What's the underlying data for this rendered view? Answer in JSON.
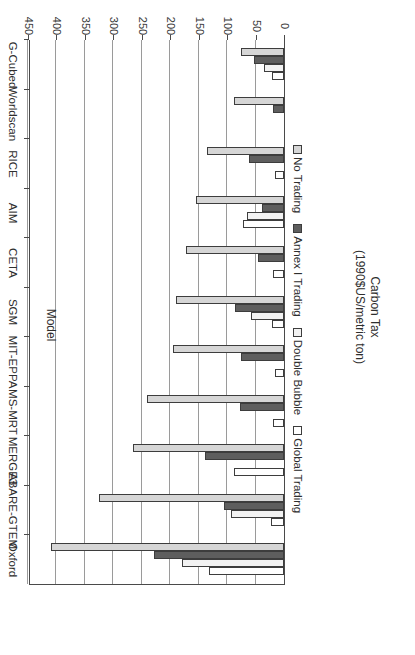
{
  "chart_data": {
    "type": "bar",
    "orientation": "horizontal",
    "title": "",
    "xlabel": "Carbon Tax (1990$US/metric ton)",
    "ylabel": "Model",
    "xlabel_line1": "Carbon Tax",
    "xlabel_line2": "(1990$US/metric ton)",
    "categories": [
      "Oxford",
      "ABARE-GTEM",
      "MERGE3",
      "MS-MRT",
      "MIT-EPPA",
      "SGM",
      "CETA",
      "AIM",
      "RICE",
      "Worldscan",
      "G-Cubed"
    ],
    "series": [
      {
        "name": "No Trading",
        "color": "#d6d6d6",
        "values": [
          410,
          325,
          265,
          240,
          195,
          190,
          173,
          155,
          135,
          88,
          76
        ]
      },
      {
        "name": "Annex I Trading",
        "color": "#5e5e5e",
        "values": [
          228,
          106,
          139,
          78,
          76,
          86,
          46,
          38,
          62,
          20,
          53
        ]
      },
      {
        "name": "Double Bubble",
        "color": "#f2f2f2",
        "values": [
          179,
          93,
          0,
          0,
          0,
          58,
          0,
          65,
          0,
          0,
          36
        ]
      },
      {
        "name": "Global Trading",
        "color": "#ffffff",
        "values": [
          131,
          23,
          88,
          19,
          15,
          21,
          19,
          72,
          15,
          0,
          21
        ]
      }
    ],
    "xlim": [
      0,
      450
    ],
    "xticks": [
      0,
      50,
      100,
      150,
      200,
      250,
      300,
      350,
      400,
      450
    ],
    "grid": true,
    "legend_position": "bottom",
    "rotated_180": true
  }
}
